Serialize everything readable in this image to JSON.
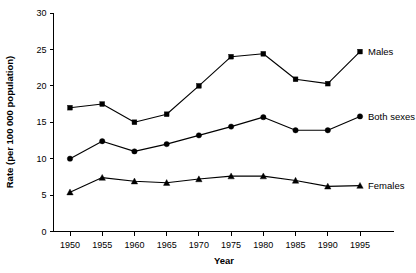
{
  "chart_data": {
    "type": "line",
    "title": "",
    "subtitle": "",
    "xlabel": "Year",
    "ylabel": "Rate (per 100 000 population)",
    "x": [
      1950,
      1955,
      1960,
      1965,
      1970,
      1975,
      1980,
      1985,
      1990,
      1995
    ],
    "categories": [
      "1950",
      "1955",
      "1960",
      "1965",
      "1970",
      "1975",
      "1980",
      "1985",
      "1990",
      "1995"
    ],
    "xlim": [
      1947.5,
      1997.5
    ],
    "ylim": [
      0,
      30
    ],
    "y_ticks": [
      0,
      5,
      10,
      15,
      20,
      25,
      30
    ],
    "x_ticks": [
      1950,
      1955,
      1960,
      1965,
      1970,
      1975,
      1980,
      1985,
      1990,
      1995
    ],
    "grid": false,
    "legend": "inline-right-of-series",
    "series": [
      {
        "name": "Males",
        "marker": "square",
        "color": "#000000",
        "values": [
          17.0,
          17.5,
          15.0,
          16.1,
          20.0,
          24.0,
          24.4,
          20.9,
          20.3,
          24.7
        ]
      },
      {
        "name": "Both sexes",
        "marker": "circle",
        "color": "#000000",
        "values": [
          10.0,
          12.4,
          11.0,
          12.0,
          13.2,
          14.4,
          15.7,
          13.9,
          13.9,
          15.8
        ]
      },
      {
        "name": "Females",
        "marker": "triangle",
        "color": "#000000",
        "values": [
          5.4,
          7.4,
          6.9,
          6.7,
          7.2,
          7.6,
          7.6,
          7.0,
          6.2,
          6.3
        ]
      }
    ],
    "annotations": [
      {
        "text": "Males",
        "series": "Males",
        "position": "right-end"
      },
      {
        "text": "Both sexes",
        "series": "Both sexes",
        "position": "right-end"
      },
      {
        "text": "Females",
        "series": "Females",
        "position": "right-end"
      }
    ]
  },
  "axis": {
    "y_tick_labels": [
      "0",
      "5",
      "10",
      "15",
      "20",
      "25",
      "30"
    ],
    "x_tick_labels": [
      "1950",
      "1955",
      "1960",
      "1965",
      "1970",
      "1975",
      "1980",
      "1985",
      "1990",
      "1995"
    ],
    "x_title": "Year",
    "y_title": "Rate (per 100 000 population)"
  },
  "labels": {
    "males": "Males",
    "both_sexes": "Both sexes",
    "females": "Females"
  },
  "style": {
    "axis_color": "#000000",
    "line_color": "#000000",
    "background": "#ffffff"
  }
}
